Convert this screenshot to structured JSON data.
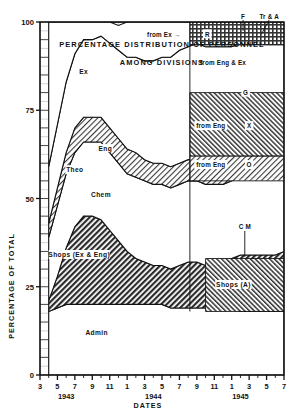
{
  "figure": {
    "title_line1": "PERCENTAGE  DISTRIBUTION  OF  PERSONNEL",
    "title_line2": "AMONG   DIVISIONS",
    "ylabel": "PERCENTAGE OF TOTAL",
    "xlabel": "DATES"
  },
  "chart_data": {
    "type": "area",
    "subtitle": "AMONG DIVISIONS",
    "xlabel": "DATES",
    "ylabel": "PERCENTAGE OF TOTAL",
    "ylim": [
      0,
      100
    ],
    "yticks": [
      0,
      25,
      50,
      75,
      100
    ],
    "ytick_labels": [
      "0",
      "25",
      "50",
      "75",
      "100"
    ],
    "xlim": [
      3,
      31
    ],
    "grid": true,
    "legend_position": "inline-labels",
    "xticks": [
      3,
      5,
      7,
      9,
      11,
      13,
      15,
      17,
      19,
      21,
      23,
      25,
      27,
      29,
      31
    ],
    "xtick_labels": [
      "3",
      "5",
      "7",
      "9",
      "11",
      "1",
      "3",
      "5",
      "7",
      "9",
      "11",
      "1",
      "3",
      "5",
      "7"
    ],
    "year_labels": [
      {
        "text": "1943",
        "x": 6
      },
      {
        "text": "1944",
        "x": 16
      },
      {
        "text": "1945",
        "x": 26
      }
    ],
    "x_months": [
      4,
      5,
      6,
      7,
      8,
      9,
      10,
      11,
      12,
      13,
      14,
      15,
      16,
      17,
      18,
      19,
      20,
      21,
      22,
      23,
      24,
      25,
      26,
      27,
      28,
      29,
      30,
      31
    ],
    "series": [
      {
        "name": "Admin",
        "label": "Admin",
        "fill": "white",
        "values": [
          18,
          19,
          20,
          20,
          20,
          20,
          20,
          20,
          20,
          20,
          20,
          20,
          20,
          20,
          19,
          19,
          19,
          19,
          19,
          19,
          19,
          19,
          18,
          18,
          18,
          18,
          18,
          18
        ]
      },
      {
        "name": "Shops (Ex & Eng)",
        "label": "Shops (Ex & Eng)",
        "fill": "dark-hatch",
        "values": [
          3,
          9,
          16,
          22,
          25,
          25,
          24,
          21,
          18,
          15,
          13,
          12,
          11,
          11,
          11,
          12,
          13,
          13,
          12,
          12,
          12,
          14,
          16,
          16,
          16,
          16,
          16,
          17
        ]
      },
      {
        "name": "Chem",
        "label": "Chem",
        "fill": "white",
        "values": [
          18,
          20,
          21,
          21,
          21,
          21,
          22,
          22,
          22,
          22,
          23,
          23,
          23,
          23,
          23,
          23,
          23,
          23,
          23,
          23,
          23,
          22,
          22,
          22,
          22,
          22,
          22,
          21
        ]
      },
      {
        "name": "Theo",
        "label": "Theo",
        "fill": "light-hatch",
        "values": [
          4,
          5,
          6,
          7,
          7,
          7,
          7,
          7,
          7,
          7,
          7,
          6,
          6,
          6,
          6,
          6,
          6,
          6,
          6,
          6,
          6,
          6,
          6,
          6,
          6,
          6,
          6,
          6
        ]
      },
      {
        "name": "Eng",
        "label": "Eng",
        "fill": "white",
        "values": [
          16,
          18,
          20,
          21,
          22,
          22,
          23,
          24,
          25,
          26,
          27,
          28,
          29,
          30,
          31,
          32,
          32,
          33,
          33,
          33,
          33,
          32,
          32,
          32,
          32,
          32,
          32,
          32
        ]
      },
      {
        "name": "Ex",
        "label": "Ex",
        "fill": "white",
        "values": [
          41,
          29,
          17,
          9,
          5,
          5,
          4,
          6,
          7,
          10,
          10,
          11,
          11,
          10,
          10,
          8,
          7,
          6,
          7,
          7,
          7,
          8,
          6,
          6,
          6,
          6,
          6,
          6
        ]
      }
    ],
    "annotations": [
      {
        "text": "Ex",
        "x": 8.0,
        "y": 86,
        "kind": "band-label"
      },
      {
        "text": "Eng",
        "x": 10.5,
        "y": 64,
        "kind": "band-label"
      },
      {
        "text": "Theo",
        "x": 7.0,
        "y": 58,
        "kind": "band-label"
      },
      {
        "text": "Chem",
        "x": 10.0,
        "y": 51,
        "kind": "band-label"
      },
      {
        "text": "Shops (Ex & Eng)",
        "x": 7.5,
        "y": 34,
        "kind": "band-label"
      },
      {
        "text": "Admin",
        "x": 9.5,
        "y": 12,
        "kind": "band-label"
      },
      {
        "text": "from Ex →",
        "x": 17.2,
        "y": 96.5,
        "kind": "callout"
      },
      {
        "text": "R",
        "x": 22.2,
        "y": 96.5,
        "kind": "segment-label"
      },
      {
        "text": "F",
        "x": 26.3,
        "y": 101.5,
        "kind": "leader-label"
      },
      {
        "text": "Tr & A",
        "x": 29.3,
        "y": 101.5,
        "kind": "leader-label"
      },
      {
        "text": "from Eng & Ex",
        "x": 24.0,
        "y": 88.5,
        "kind": "callout"
      },
      {
        "text": "G",
        "x": 26.6,
        "y": 80.0,
        "kind": "segment-label"
      },
      {
        "text": "from Eng",
        "x": 22.6,
        "y": 70.5,
        "kind": "callout"
      },
      {
        "text": "X",
        "x": 27.0,
        "y": 70.5,
        "kind": "segment-label"
      },
      {
        "text": "from Eng",
        "x": 22.6,
        "y": 59.5,
        "kind": "callout"
      },
      {
        "text": "O",
        "x": 27.0,
        "y": 59.5,
        "kind": "segment-label"
      },
      {
        "text": "C M",
        "x": 26.5,
        "y": 42.0,
        "kind": "leader-label"
      },
      {
        "text": "Shops (A)",
        "x": 25.2,
        "y": 25.5,
        "kind": "band-label"
      }
    ]
  }
}
